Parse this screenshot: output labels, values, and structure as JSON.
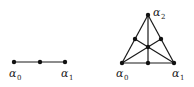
{
  "figure": {
    "simplex1": {
      "vertices": [
        {
          "id": "a0",
          "label": "α",
          "subscript": "0"
        },
        {
          "id": "a1",
          "label": "α",
          "subscript": "1"
        }
      ],
      "points": [
        "vertex a0",
        "midpoint",
        "vertex a1"
      ]
    },
    "simplex2": {
      "vertices": [
        {
          "id": "a0",
          "label": "α",
          "subscript": "0"
        },
        {
          "id": "a1",
          "label": "α",
          "subscript": "1"
        },
        {
          "id": "a2",
          "label": "α",
          "subscript": "2"
        }
      ],
      "points": [
        "vertex a0",
        "vertex a1",
        "vertex a2",
        "midpoint a0a1",
        "midpoint a1a2",
        "midpoint a0a2",
        "barycenter"
      ]
    }
  }
}
